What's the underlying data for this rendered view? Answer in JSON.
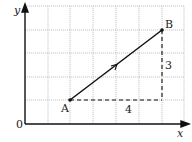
{
  "diagram": {
    "axes": {
      "x_label": "x",
      "y_label": "y",
      "origin_label": "0"
    },
    "points": [
      {
        "name": "A",
        "grid": [
          2,
          1
        ]
      },
      {
        "name": "B",
        "grid": [
          6,
          4
        ]
      }
    ],
    "run_label": "4",
    "rise_label": "3",
    "grid": {
      "columns": 7,
      "rows": 5
    },
    "colors": {
      "grid": "#b8b8b8",
      "line": "#111111"
    }
  }
}
